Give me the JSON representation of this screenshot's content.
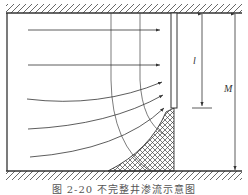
{
  "figure": {
    "caption": "图 2-20  不完整井渗流示意图",
    "labels": {
      "screen_length": "l",
      "aquifer_thickness": "M"
    },
    "elements": {
      "top_boundary": "impermeable-top",
      "bottom_boundary": "impermeable-bottom",
      "well": "partially-penetrating-well",
      "dead_zone": "cross-hatched-zone",
      "flow_lines": 5,
      "equipotential_lines": 2
    },
    "colors": {
      "line": "#333333",
      "background": "#ffffff"
    }
  }
}
